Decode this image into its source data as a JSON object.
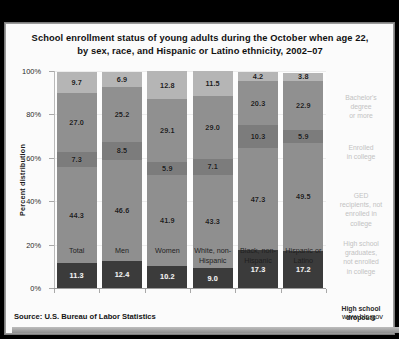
{
  "chart_data": {
    "type": "bar",
    "subtype": "stacked-percent",
    "title": "School enrollment status of young adults during the October when age 22, by sex, race, and Hispanic or Latino ethnicity, 2002–07",
    "title_line1": "School enrollment status of young adults during the October when age 22,",
    "title_line2": "by sex, race, and Hispanic or Latino ethnicity, 2002–07",
    "xlabel": "",
    "ylabel": "Percent distribution",
    "ylim": [
      0,
      100
    ],
    "ytick_labels": [
      "0%",
      "20%",
      "40%",
      "60%",
      "80%",
      "100%"
    ],
    "ytick_values": [
      0,
      20,
      40,
      60,
      80,
      100
    ],
    "grid": true,
    "legend_position": "right",
    "categories": [
      "Total",
      "Men",
      "Women",
      "White, non-Hispanic",
      "Black, non-Hispanic",
      "Hispanic or Latino"
    ],
    "category_lines": [
      [
        "Total",
        ""
      ],
      [
        "Men",
        ""
      ],
      [
        "Women",
        ""
      ],
      [
        "White, non-",
        "Hispanic"
      ],
      [
        "Black, non-",
        "Hispanic"
      ],
      [
        "Hispanic or",
        "Latino"
      ]
    ],
    "series": [
      {
        "name": "High school dropouts",
        "name_lines": [
          "High school",
          "dropouts"
        ],
        "color": "#3b3b3b",
        "values": [
          11.3,
          12.4,
          10.2,
          9.0,
          17.3,
          17.2
        ]
      },
      {
        "name": "High school graduates, not enrolled in college",
        "name_lines": [
          "High school",
          "graduates,",
          "not enrolled",
          "in college"
        ],
        "color": "#8f8f8f",
        "values": [
          44.3,
          46.6,
          41.9,
          43.3,
          47.3,
          49.5
        ]
      },
      {
        "name": "GED recipients, not enrolled in college",
        "name_lines": [
          "GED",
          "recipients, not",
          "enrolled in",
          "college"
        ],
        "color": "#7c7c7c",
        "values": [
          7.3,
          8.5,
          5.9,
          7.1,
          10.3,
          5.9
        ]
      },
      {
        "name": "Enrolled in college",
        "name_lines": [
          "Enrolled",
          "in college"
        ],
        "color": "#909090",
        "values": [
          27.0,
          25.2,
          29.1,
          29.0,
          20.3,
          22.9
        ]
      },
      {
        "name": "Bachelor's degree or more",
        "name_lines": [
          "Bachelor's",
          "degree",
          "or more"
        ],
        "color": "#b5b5b5",
        "values": [
          9.7,
          6.9,
          12.8,
          11.5,
          4.2,
          3.8
        ]
      }
    ]
  },
  "footer": {
    "source": "Source: U.S. Bureau of Labor Statistics",
    "url": "www.bls.gov"
  }
}
